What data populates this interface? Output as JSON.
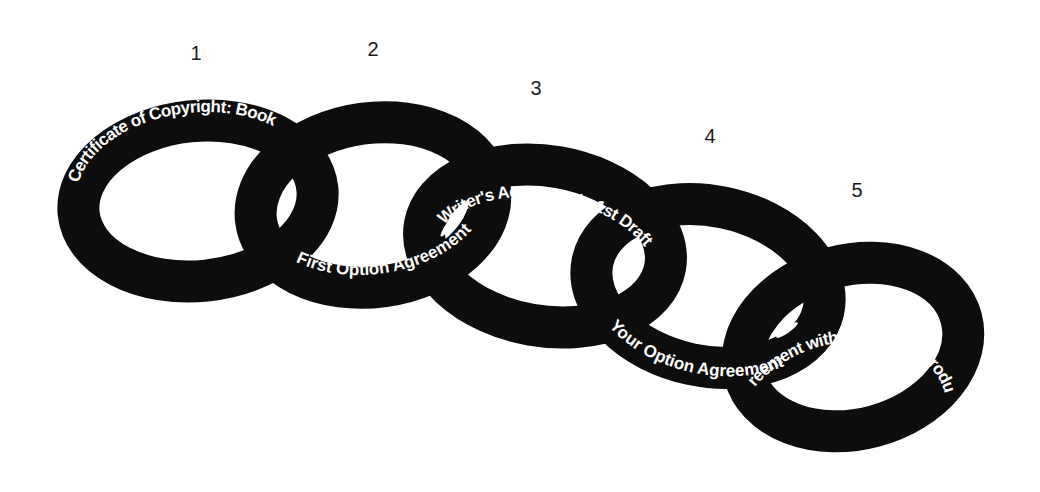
{
  "diagram": {
    "type": "interlocking-chain",
    "colors": {
      "ring": "#0d0d0d",
      "label": "#ffffff",
      "number": "#1a1a1a",
      "background": "#ffffff"
    },
    "links": [
      {
        "number": "1",
        "label": "Certificate of Copyright: Book"
      },
      {
        "number": "2",
        "label": "First Option Agreement"
      },
      {
        "number": "3",
        "label": "Writer's Agreement - 1st Draft"
      },
      {
        "number": "4",
        "label": "Your Option Agreement"
      },
      {
        "number": "5",
        "label": "Agreement with your Joint Producer"
      }
    ]
  }
}
